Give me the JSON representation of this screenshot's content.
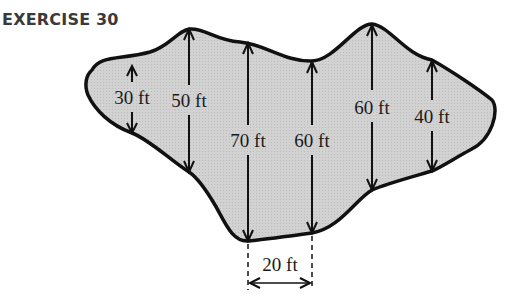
{
  "title": "EXERCISE 30",
  "colors": {
    "fill": "#cfcfcf",
    "outline": "#111111",
    "text": "#1a1a1a",
    "title": "#3a3a3a"
  },
  "figure": {
    "spacing_label": "20 ft",
    "measurements": [
      {
        "label": "30 ft",
        "value": 30
      },
      {
        "label": "50 ft",
        "value": 50
      },
      {
        "label": "70 ft",
        "value": 70
      },
      {
        "label": "60 ft",
        "value": 60
      },
      {
        "label": "60 ft",
        "value": 60
      },
      {
        "label": "40 ft",
        "value": 40
      }
    ]
  }
}
